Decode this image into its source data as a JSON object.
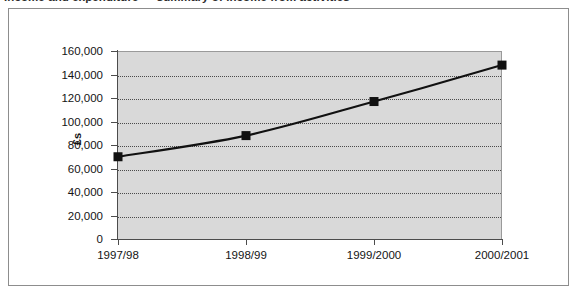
{
  "document": {
    "heading_partial": "Income and expenditure — summary of income from activities"
  },
  "figure": {
    "frame_border_color": "#8d8d8d",
    "background_color": "#ffffff"
  },
  "chart_data": {
    "type": "line",
    "title": "",
    "categories": [
      "1997/98",
      "1998/99",
      "1999/2000",
      "2000/2001"
    ],
    "values": [
      70000,
      88000,
      117000,
      148000
    ],
    "series": [
      {
        "name": "Income",
        "values": [
          70000,
          88000,
          117000,
          148000
        ]
      }
    ],
    "xlabel": "",
    "ylabel": "£s",
    "ylim": [
      0,
      160000
    ],
    "y_ticks": [
      0,
      20000,
      40000,
      60000,
      80000,
      100000,
      120000,
      140000,
      160000
    ],
    "y_tick_labels": [
      "160,000",
      "140,000",
      "120,000",
      "100,000",
      "80,000",
      "60,000",
      "40,000",
      "20,000",
      "0"
    ],
    "grid": true,
    "grid_style": "dotted",
    "grid_color": "#4a4a4a",
    "legend": false,
    "legend_position": "none",
    "plot_background_color": "#d9d9d9",
    "line_color": "#111111",
    "marker_color": "#111111",
    "marker_shape": "square",
    "smoothed": true
  }
}
